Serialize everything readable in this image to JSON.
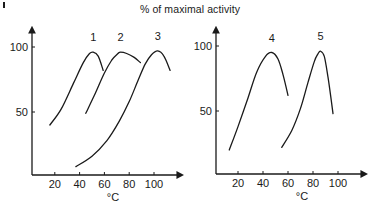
{
  "chart_data": [
    {
      "type": "line",
      "title": "% of maximal activity",
      "xlabel": "°C",
      "ylabel": "% of maximal activity",
      "xticks": [
        20,
        40,
        60,
        80,
        100
      ],
      "yticks": [
        50,
        100
      ],
      "xlim": [
        0,
        118
      ],
      "ylim": [
        0,
        125
      ],
      "grid": false,
      "legend": "curve number labels above peaks",
      "series": [
        {
          "name": "1",
          "x": [
            16,
            25,
            35,
            43,
            48,
            51,
            55,
            59
          ],
          "y": [
            40,
            52,
            72,
            88,
            95,
            96,
            93,
            82
          ]
        },
        {
          "name": "2",
          "x": [
            45,
            52,
            60,
            66,
            71,
            73,
            78,
            84,
            89
          ],
          "y": [
            49,
            63,
            80,
            90,
            95,
            96,
            95,
            92,
            88
          ]
        },
        {
          "name": "3",
          "x": [
            37,
            50,
            62,
            72,
            80,
            87,
            93,
            98,
            103,
            108,
            113
          ],
          "y": [
            8,
            16,
            28,
            43,
            58,
            74,
            87,
            94,
            97,
            93,
            82
          ]
        }
      ]
    },
    {
      "type": "line",
      "title": "% of maximal activity",
      "xlabel": "°C",
      "ylabel": "% of maximal activity",
      "xticks": [
        20,
        40,
        60,
        80,
        100
      ],
      "yticks": [
        50,
        100
      ],
      "xlim": [
        0,
        118
      ],
      "ylim": [
        0,
        125
      ],
      "grid": false,
      "legend": "curve number labels above peaks",
      "series": [
        {
          "name": "4",
          "x": [
            13,
            20,
            28,
            35,
            42,
            47,
            52,
            56,
            60
          ],
          "y": [
            20,
            38,
            60,
            80,
            92,
            95,
            90,
            78,
            62
          ]
        },
        {
          "name": "5",
          "x": [
            55,
            63,
            70,
            76,
            81,
            84,
            86,
            89,
            92,
            96
          ],
          "y": [
            22,
            35,
            52,
            72,
            88,
            94,
            96,
            92,
            76,
            48
          ]
        }
      ]
    }
  ],
  "labels": {
    "title": "% of maximal activity",
    "x_unit": "°C",
    "ytick_100": "100",
    "ytick_50": "50",
    "xticks": [
      "20",
      "40",
      "60",
      "80",
      "100"
    ],
    "curves": [
      "1",
      "2",
      "3",
      "4",
      "5"
    ]
  }
}
